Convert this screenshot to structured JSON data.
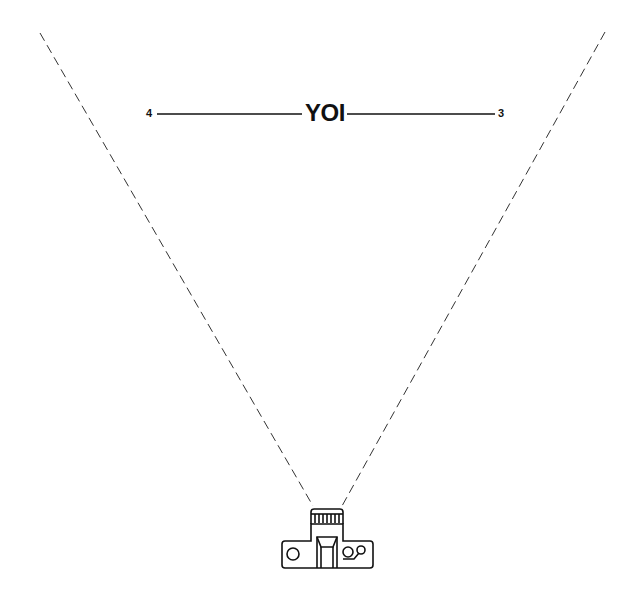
{
  "diagram": {
    "title": "YOI",
    "left_marker": "4",
    "right_marker": "3",
    "subject_icon": "camera-top-view-icon",
    "field_of_view": "dashed-lines",
    "colors": {
      "line": "#111111",
      "dashed": "#333333",
      "background": "#ffffff"
    }
  }
}
